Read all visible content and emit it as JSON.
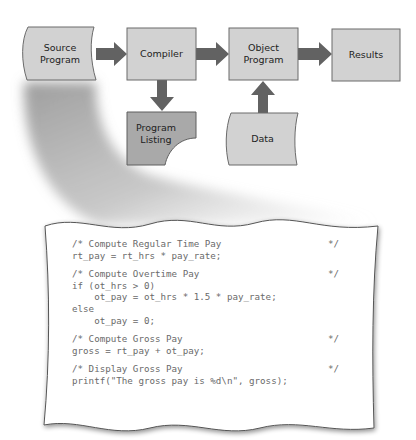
{
  "diagram": {
    "nodes": [
      {
        "id": "source_program",
        "lines": [
          "Source",
          "Program"
        ],
        "shape": "document-punched"
      },
      {
        "id": "compiler",
        "lines": [
          "Compiler"
        ],
        "shape": "rect"
      },
      {
        "id": "object_program",
        "lines": [
          "Object",
          "Program"
        ],
        "shape": "rect"
      },
      {
        "id": "results",
        "lines": [
          "Results"
        ],
        "shape": "rect"
      },
      {
        "id": "program_listing",
        "lines": [
          "Program",
          "Listing"
        ],
        "shape": "printout"
      },
      {
        "id": "data",
        "lines": [
          "Data"
        ],
        "shape": "document-punched"
      }
    ],
    "edges": [
      {
        "from": "source_program",
        "to": "compiler"
      },
      {
        "from": "compiler",
        "to": "object_program"
      },
      {
        "from": "object_program",
        "to": "results"
      },
      {
        "from": "compiler",
        "to": "program_listing"
      },
      {
        "from": "data",
        "to": "object_program"
      }
    ],
    "colors": {
      "box_fill": "#d2d2d2",
      "listing_fill": "#a9a9a9",
      "box_stroke": "#6b6b6b",
      "arrow": "#626262",
      "shadow": "#9a9a9a",
      "code_text": "#6a6a6a"
    }
  },
  "code_listing": {
    "blocks": [
      {
        "lines": [
          {
            "text": "/* Compute Regular Time Pay",
            "end": "*/"
          },
          {
            "text": "rt_pay = rt_hrs * pay_rate;",
            "end": ""
          }
        ]
      },
      {
        "lines": [
          {
            "text": "/* Compute Overtime Pay",
            "end": "*/"
          },
          {
            "text": "if (ot_hrs > 0)",
            "end": ""
          },
          {
            "text": "    ot_pay = ot_hrs * 1.5 * pay_rate;",
            "end": ""
          },
          {
            "text": "else",
            "end": ""
          },
          {
            "text": "    ot_pay = 0;",
            "end": ""
          }
        ]
      },
      {
        "lines": [
          {
            "text": "/* Compute Gross Pay",
            "end": "*/"
          },
          {
            "text": "gross = rt_pay + ot_pay;",
            "end": ""
          }
        ]
      },
      {
        "lines": [
          {
            "text": "/* Display Gross Pay",
            "end": "*/"
          },
          {
            "text": "printf(\"The gross pay is %d\\n\", gross);",
            "end": ""
          }
        ]
      }
    ]
  }
}
